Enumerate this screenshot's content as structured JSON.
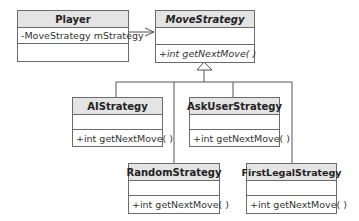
{
  "diagram": {
    "type": "uml-class-diagram",
    "classes": [
      {
        "name": "Player",
        "abstract": false,
        "attributes": [
          "-MoveStrategy mStrategy"
        ],
        "methods": [
          ""
        ]
      },
      {
        "name": "MoveStrategy",
        "abstract": true,
        "attributes": [
          ""
        ],
        "methods": [
          "+int getNextMove( )"
        ]
      },
      {
        "name": "AIStrategy",
        "abstract": false,
        "attributes": [
          ""
        ],
        "methods": [
          "+int getNextMove( )"
        ]
      },
      {
        "name": "AskUserStrategy",
        "abstract": false,
        "attributes": [
          ""
        ],
        "methods": [
          "+int getNextMove( )"
        ]
      },
      {
        "name": "RandomStrategy",
        "abstract": false,
        "attributes": [
          ""
        ],
        "methods": [
          "+int getNextMove( )"
        ]
      },
      {
        "name": "FirstLegalStrategy",
        "abstract": false,
        "attributes": [
          ""
        ],
        "methods": [
          "+int getNextMove( )"
        ]
      }
    ],
    "relations": [
      {
        "type": "association",
        "from": "Player",
        "to": "MoveStrategy"
      },
      {
        "type": "generalization",
        "from": "AIStrategy",
        "to": "MoveStrategy"
      },
      {
        "type": "generalization",
        "from": "AskUserStrategy",
        "to": "MoveStrategy"
      },
      {
        "type": "generalization",
        "from": "RandomStrategy",
        "to": "MoveStrategy"
      },
      {
        "type": "generalization",
        "from": "FirstLegalStrategy",
        "to": "MoveStrategy"
      }
    ]
  }
}
